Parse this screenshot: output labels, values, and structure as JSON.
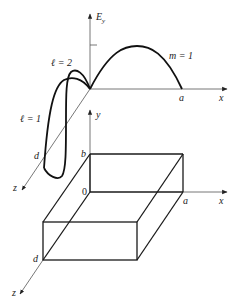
{
  "figure": {
    "top_plot": {
      "axis_vertical_label": "E",
      "axis_vertical_subscript": "y",
      "axis_x_label": "x",
      "axis_z_label": "z",
      "point_a_label": "a",
      "point_d_label": "d",
      "mode_m_label": "m = 1",
      "mode_l2_label": "ℓ = 2",
      "mode_l1_label": "ℓ = 1"
    },
    "bottom_box": {
      "axis_y_label": "y",
      "axis_x_label": "x",
      "axis_z_label": "z",
      "origin_label": "0",
      "point_a_label": "a",
      "point_b_label": "b",
      "point_d_label": "d"
    }
  }
}
